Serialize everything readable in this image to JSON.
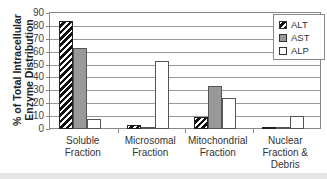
{
  "chart_data": {
    "type": "bar",
    "title": "",
    "xlabel": "",
    "ylabel": "% of Total Intracellular Enzyme Distribution",
    "ylabel_lines": [
      "% of Total Intracellular",
      "Enzyme Distribution"
    ],
    "ylim": [
      0,
      90
    ],
    "yticks": [
      "0",
      "10",
      "20",
      "30",
      "40",
      "50",
      "60",
      "70",
      "80",
      "90"
    ],
    "grid": true,
    "legend_position": "top-right",
    "categories": [
      "Soluble Fraction",
      "Microsomal Fraction",
      "Mitochondrial Fraction",
      "Nuclear Fraction & Debris"
    ],
    "category_lines": [
      [
        "Soluble",
        "Fraction"
      ],
      [
        "Microsomal",
        "Fraction"
      ],
      [
        "Mitochondrial",
        "Fraction"
      ],
      [
        "Nuclear",
        "Fraction &",
        "Debris"
      ]
    ],
    "series": [
      {
        "name": "ALT",
        "pattern": "diagonal-hatch",
        "values": [
          84,
          3,
          9,
          1
        ]
      },
      {
        "name": "AST",
        "color": "#999999",
        "values": [
          63,
          1,
          33,
          0.5
        ]
      },
      {
        "name": "ALP",
        "color": "#ffffff",
        "values": [
          8,
          53,
          24,
          10
        ]
      }
    ]
  },
  "legend": {
    "items": [
      "ALT",
      "AST",
      "ALP"
    ]
  }
}
